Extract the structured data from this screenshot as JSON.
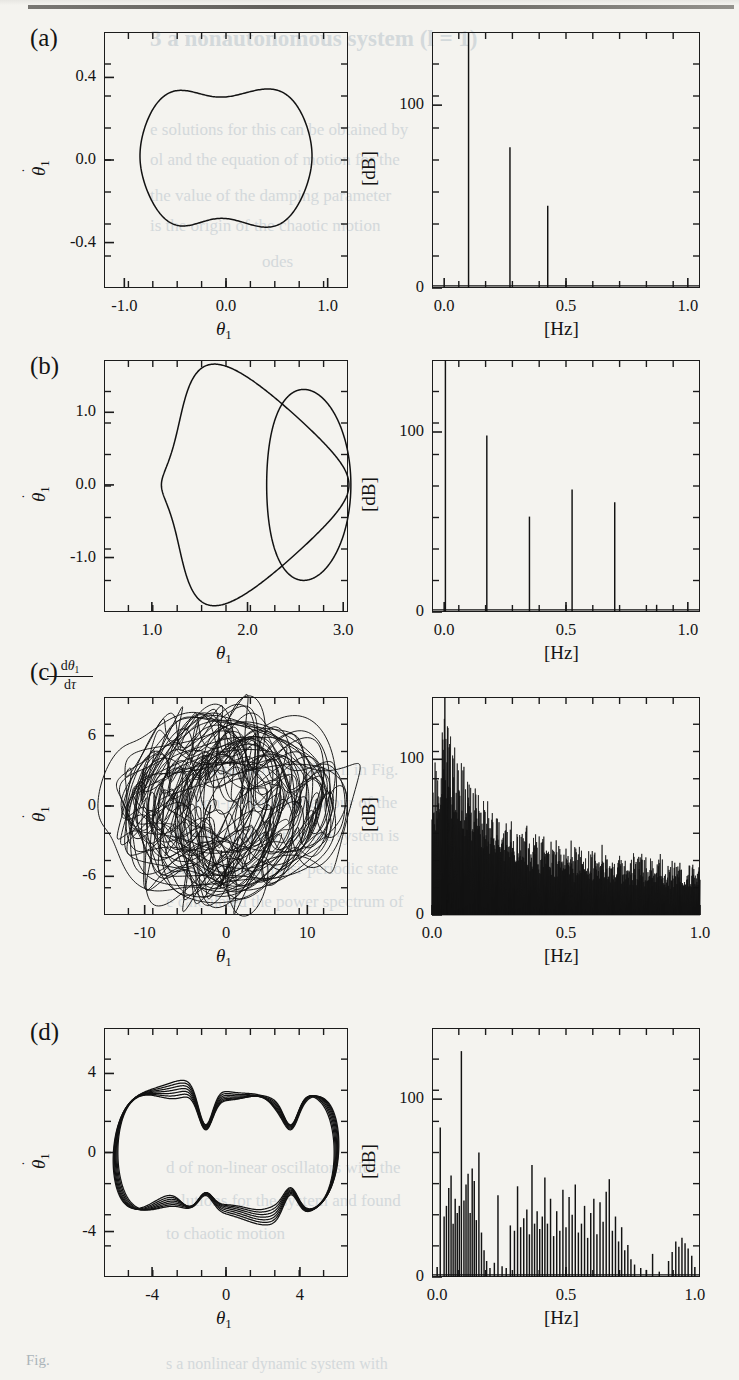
{
  "figure": {
    "caption_fragment": "Fig.",
    "panels": [
      "(a)",
      "(b)",
      "(c)",
      "(d)"
    ]
  },
  "ghost_text": [
    {
      "t": "3   a nonautonomous system (l = 1)",
      "x": 150,
      "y": 26,
      "size": 23,
      "weight": "700"
    },
    {
      "t": "e solutions for this can be obtained by",
      "x": 150,
      "y": 120,
      "size": 17
    },
    {
      "t": "ol and the equation of motion for the",
      "x": 150,
      "y": 150,
      "size": 17
    },
    {
      "t": "the value of the damping parameter",
      "x": 150,
      "y": 186,
      "size": 17
    },
    {
      "t": "is the origin of the chaotic motion",
      "x": 150,
      "y": 216,
      "size": 17
    },
    {
      "t": "odes",
      "x": 262,
      "y": 252,
      "size": 17
    },
    {
      "t": "the chaotic attractor shown in Fig.",
      "x": 166,
      "y": 760,
      "size": 17
    },
    {
      "t": "and non-periodic behaviour of the",
      "x": 166,
      "y": 793,
      "size": 17
    },
    {
      "t": "order to confirm that the system is",
      "x": 166,
      "y": 826,
      "size": 17
    },
    {
      "t": "nsition from a quasi-periodic state",
      "x": 166,
      "y": 859,
      "size": 17
    },
    {
      "t": "e calculated the power spectrum of",
      "x": 166,
      "y": 892,
      "size": 17
    },
    {
      "t": "d of non-linear oscillators with the",
      "x": 166,
      "y": 1158,
      "size": 17
    },
    {
      "t": "solutions for the system and found",
      "x": 166,
      "y": 1191,
      "size": 17
    },
    {
      "t": "to chaotic motion",
      "x": 166,
      "y": 1224,
      "size": 17
    },
    {
      "t": "s a nonlinear dynamic system with",
      "x": 166,
      "y": 1355,
      "size": 16
    }
  ],
  "panels": [
    {
      "tag": "(a)",
      "phase": {
        "type": "line",
        "title": "",
        "xlabel": "θ1",
        "ylabel": "θ̇1",
        "xlim": [
          -1.2,
          1.2
        ],
        "ylim": [
          -0.62,
          0.62
        ],
        "xticks": [
          -1.0,
          0.0,
          1.0
        ],
        "xticklabels": [
          "-1.0",
          "0.0",
          "1.0"
        ],
        "yticks": [
          -0.4,
          0.0,
          0.4
        ],
        "yticklabels": [
          "-0.4",
          "0.0",
          "0.4"
        ],
        "description": "single closed limit-cycle orbit, peanut/apple shaped"
      },
      "spectrum": {
        "type": "bar",
        "xlabel": "[Hz]",
        "ylabel": "[dB]",
        "xlim": [
          -0.05,
          1.05
        ],
        "ylim": [
          0,
          140
        ],
        "xticks": [
          0.0,
          0.5,
          1.0
        ],
        "xticklabels": [
          "0.0",
          "0.5",
          "1.0"
        ],
        "yticks": [
          0,
          100
        ],
        "yticklabels": [
          "0",
          "100"
        ],
        "peaks": [
          {
            "f": 0.1,
            "db": 140
          },
          {
            "f": 0.27,
            "db": 77
          },
          {
            "f": 0.425,
            "db": 45
          }
        ]
      }
    },
    {
      "tag": "(b)",
      "phase": {
        "type": "line",
        "xlabel": "θ1",
        "ylabel": "θ̇1",
        "xlim": [
          0.5,
          3.05
        ],
        "ylim": [
          -1.75,
          1.72
        ],
        "xticks": [
          1.0,
          2.0,
          3.0
        ],
        "xticklabels": [
          "1.0",
          "2.0",
          "3.0"
        ],
        "yticks": [
          -1.0,
          0.0,
          1.0
        ],
        "yticklabels": [
          "-1.0",
          "0.0",
          "1.0"
        ],
        "description": "period-2 closed orbit with two lobes and a cusp near theta=2.15"
      },
      "spectrum": {
        "type": "bar",
        "xlabel": "[Hz]",
        "ylabel": "[dB]",
        "xlim": [
          -0.05,
          1.05
        ],
        "ylim": [
          0,
          140
        ],
        "xticks": [
          0.0,
          0.5,
          1.0
        ],
        "xticklabels": [
          "0.0",
          "0.5",
          "1.0"
        ],
        "yticks": [
          0,
          100
        ],
        "yticklabels": [
          "0",
          "100"
        ],
        "peaks": [
          {
            "f": 0.005,
            "db": 140
          },
          {
            "f": 0.175,
            "db": 98
          },
          {
            "f": 0.35,
            "db": 53
          },
          {
            "f": 0.525,
            "db": 68
          },
          {
            "f": 0.7,
            "db": 61
          },
          {
            "f": 0.872,
            "db": 4
          }
        ]
      }
    },
    {
      "tag": "(c)",
      "phase": {
        "type": "line",
        "xlabel": "θ1",
        "ylabel": "θ̇1",
        "ylabel_frac_num": "dθ1",
        "ylabel_frac_den": "dτ",
        "xlim": [
          -15,
          15
        ],
        "ylim": [
          -9.3,
          9.3
        ],
        "xticks": [
          -10,
          0,
          10
        ],
        "xticklabels": [
          "-10",
          "0",
          "10"
        ],
        "yticks": [
          -6,
          0,
          6
        ],
        "yticklabels": [
          "-6",
          "0",
          "6"
        ],
        "description": "chaotic attractor, dense tangle of trajectories"
      },
      "spectrum": {
        "type": "area",
        "xlabel": "[Hz]",
        "ylabel": "[dB]",
        "xlim": [
          0.0,
          1.0
        ],
        "ylim": [
          0,
          140
        ],
        "xticks": [
          0.0,
          0.5,
          1.0
        ],
        "xticklabels": [
          "0.0",
          "0.5",
          "1.0"
        ],
        "yticks": [
          0,
          100
        ],
        "yticklabels": [
          "0",
          "100"
        ],
        "envelope": [
          {
            "f": 0.0,
            "db": 88
          },
          {
            "f": 0.02,
            "db": 100
          },
          {
            "f": 0.045,
            "db": 126
          },
          {
            "f": 0.07,
            "db": 112
          },
          {
            "f": 0.1,
            "db": 98
          },
          {
            "f": 0.14,
            "db": 88
          },
          {
            "f": 0.18,
            "db": 80
          },
          {
            "f": 0.22,
            "db": 72
          },
          {
            "f": 0.27,
            "db": 64
          },
          {
            "f": 0.32,
            "db": 58
          },
          {
            "f": 0.38,
            "db": 52
          },
          {
            "f": 0.45,
            "db": 46
          },
          {
            "f": 0.52,
            "db": 43
          },
          {
            "f": 0.6,
            "db": 41
          },
          {
            "f": 0.7,
            "db": 39
          },
          {
            "f": 0.8,
            "db": 37
          },
          {
            "f": 0.9,
            "db": 35
          },
          {
            "f": 1.0,
            "db": 33
          }
        ],
        "description": "broadband continuous spectrum decaying from ~125 dB near 0.05 Hz to ~33 dB at 1 Hz"
      }
    },
    {
      "tag": "(d)",
      "phase": {
        "type": "line",
        "xlabel": "θ1",
        "ylabel": "θ̇1",
        "xlim": [
          -6.6,
          6.6
        ],
        "ylim": [
          -6.3,
          6.3
        ],
        "xticks": [
          -4,
          0,
          4
        ],
        "xticklabels": [
          "-4",
          "0",
          "4"
        ],
        "yticks": [
          -4,
          0,
          4
        ],
        "yticklabels": [
          "-4",
          "0",
          "4"
        ],
        "description": "quasi-periodic torus, several nearly-overlapping bands"
      },
      "spectrum": {
        "type": "bar",
        "xlabel": "[Hz]",
        "ylabel": "[dB]",
        "xlim": [
          -0.02,
          1.02
        ],
        "ylim": [
          0,
          140
        ],
        "xticks": [
          0.0,
          0.5,
          1.0
        ],
        "xticklabels": [
          "0.0",
          "0.5",
          "1.0"
        ],
        "yticks": [
          0,
          100
        ],
        "yticklabels": [
          "0",
          "100"
        ],
        "peaks": [
          {
            "f": 0.012,
            "db": 84
          },
          {
            "f": 0.027,
            "db": 34
          },
          {
            "f": 0.036,
            "db": 40
          },
          {
            "f": 0.045,
            "db": 50
          },
          {
            "f": 0.054,
            "db": 57
          },
          {
            "f": 0.062,
            "db": 30
          },
          {
            "f": 0.07,
            "db": 44
          },
          {
            "f": 0.078,
            "db": 36
          },
          {
            "f": 0.086,
            "db": 40
          },
          {
            "f": 0.094,
            "db": 127
          },
          {
            "f": 0.104,
            "db": 43
          },
          {
            "f": 0.112,
            "db": 52
          },
          {
            "f": 0.12,
            "db": 58
          },
          {
            "f": 0.128,
            "db": 36
          },
          {
            "f": 0.136,
            "db": 61
          },
          {
            "f": 0.144,
            "db": 54
          },
          {
            "f": 0.152,
            "db": 32
          },
          {
            "f": 0.162,
            "db": 70
          },
          {
            "f": 0.172,
            "db": 25
          },
          {
            "f": 0.182,
            "db": 15
          },
          {
            "f": 0.192,
            "db": 9
          },
          {
            "f": 0.205,
            "db": 5
          },
          {
            "f": 0.222,
            "db": 8
          },
          {
            "f": 0.236,
            "db": 46
          },
          {
            "f": 0.252,
            "db": 6
          },
          {
            "f": 0.268,
            "db": 5
          },
          {
            "f": 0.284,
            "db": 29
          },
          {
            "f": 0.3,
            "db": 26
          },
          {
            "f": 0.312,
            "db": 51
          },
          {
            "f": 0.324,
            "db": 28
          },
          {
            "f": 0.336,
            "db": 33
          },
          {
            "f": 0.348,
            "db": 38
          },
          {
            "f": 0.358,
            "db": 24
          },
          {
            "f": 0.368,
            "db": 63
          },
          {
            "f": 0.378,
            "db": 30
          },
          {
            "f": 0.388,
            "db": 37
          },
          {
            "f": 0.398,
            "db": 27
          },
          {
            "f": 0.408,
            "db": 34
          },
          {
            "f": 0.418,
            "db": 56
          },
          {
            "f": 0.428,
            "db": 30
          },
          {
            "f": 0.44,
            "db": 44
          },
          {
            "f": 0.452,
            "db": 23
          },
          {
            "f": 0.464,
            "db": 37
          },
          {
            "f": 0.476,
            "db": 26
          },
          {
            "f": 0.488,
            "db": 49
          },
          {
            "f": 0.5,
            "db": 28
          },
          {
            "f": 0.512,
            "db": 45
          },
          {
            "f": 0.524,
            "db": 35
          },
          {
            "f": 0.536,
            "db": 52
          },
          {
            "f": 0.548,
            "db": 25
          },
          {
            "f": 0.56,
            "db": 30
          },
          {
            "f": 0.572,
            "db": 40
          },
          {
            "f": 0.584,
            "db": 22
          },
          {
            "f": 0.596,
            "db": 36
          },
          {
            "f": 0.608,
            "db": 44
          },
          {
            "f": 0.62,
            "db": 24
          },
          {
            "f": 0.632,
            "db": 42
          },
          {
            "f": 0.644,
            "db": 31
          },
          {
            "f": 0.656,
            "db": 48
          },
          {
            "f": 0.668,
            "db": 55
          },
          {
            "f": 0.68,
            "db": 26
          },
          {
            "f": 0.692,
            "db": 34
          },
          {
            "f": 0.704,
            "db": 20
          },
          {
            "f": 0.716,
            "db": 28
          },
          {
            "f": 0.728,
            "db": 15
          },
          {
            "f": 0.74,
            "db": 18
          },
          {
            "f": 0.752,
            "db": 10
          },
          {
            "f": 0.766,
            "db": 7
          },
          {
            "f": 0.79,
            "db": 5
          },
          {
            "f": 0.812,
            "db": 4
          },
          {
            "f": 0.836,
            "db": 13
          },
          {
            "f": 0.862,
            "db": 3
          },
          {
            "f": 0.898,
            "db": 9
          },
          {
            "f": 0.912,
            "db": 14
          },
          {
            "f": 0.926,
            "db": 20
          },
          {
            "f": 0.938,
            "db": 17
          },
          {
            "f": 0.95,
            "db": 22
          },
          {
            "f": 0.962,
            "db": 19
          },
          {
            "f": 0.974,
            "db": 16
          },
          {
            "f": 0.988,
            "db": 12
          }
        ]
      }
    }
  ]
}
